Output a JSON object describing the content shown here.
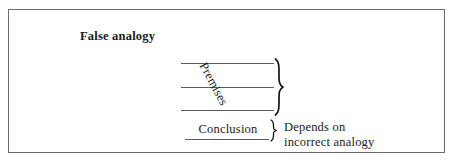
{
  "figure": {
    "title": "False analogy",
    "background_color": "#ffffff",
    "border_color": "#6d6d6d",
    "text_color": "#1a1a1a",
    "rule_color": "#59595e"
  },
  "diagram": {
    "type": "argument-structure",
    "premises": {
      "label": "Premises",
      "label_rotation_degrees": 62,
      "line_count": 3,
      "lines": [
        "",
        "",
        ""
      ],
      "brace": "}"
    },
    "conclusion": {
      "label": "Conclusion",
      "underlined": true,
      "brace": "}"
    },
    "annotation": {
      "line1": "Depends on",
      "line2": "incorrect analogy"
    }
  }
}
